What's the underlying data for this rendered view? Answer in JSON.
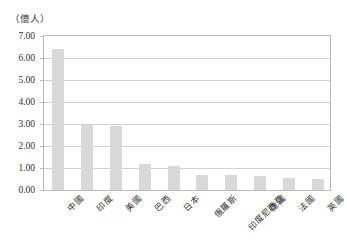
{
  "chart_data": {
    "type": "bar",
    "title": "",
    "subtitle": "",
    "unit_caption": "（億人）",
    "xlabel": "",
    "ylabel": "",
    "ylim": [
      0.0,
      7.0
    ],
    "ytick_step": 1.0,
    "grid": true,
    "legend": false,
    "bar_color": "#d9d9d9",
    "axis_color": "#b9b9b9",
    "gridline_color": "#d2d2d2",
    "text_color": "#2e2e2e",
    "categories": [
      "中國",
      "印度",
      "美國",
      "巴西",
      "日本",
      "俄羅斯",
      "印度尼西亞",
      "德國",
      "法國",
      "英國"
    ],
    "values": [
      6.4,
      2.95,
      2.9,
      1.2,
      1.1,
      0.7,
      0.68,
      0.62,
      0.55,
      0.52
    ],
    "ytick_labels": [
      "0.00",
      "1.00",
      "2.00",
      "3.00",
      "4.00",
      "5.00",
      "6.00",
      "7.00"
    ],
    "ytick_values": [
      0.0,
      1.0,
      2.0,
      3.0,
      4.0,
      5.0,
      6.0,
      7.0
    ]
  }
}
